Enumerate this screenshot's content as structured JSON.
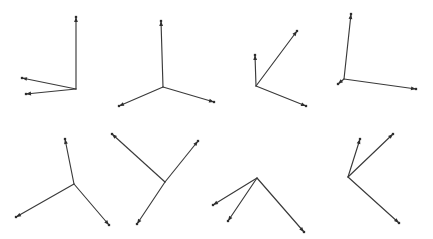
{
  "figure": {
    "title": "",
    "background_color": "#ffffff",
    "stroke_color": "#3a3a3a",
    "marker_color": "#2e2e2e",
    "width": 433,
    "height": 239
  },
  "chart_data": {
    "type": "scatter",
    "title": "",
    "xlabel": "",
    "ylabel": "",
    "xlim": [
      0,
      433
    ],
    "ylim": [
      239,
      0
    ],
    "grid": false,
    "legend": null,
    "shapes": [
      {
        "name": "arrow-figure-1",
        "row": 1,
        "column": 1,
        "vertex": [
          76,
          89
        ],
        "arms": [
          {
            "name": "arm-up",
            "tip": [
              76,
              17
            ]
          },
          {
            "name": "arm-left-upper",
            "tip": [
              22,
              78
            ]
          },
          {
            "name": "arm-left-lower",
            "tip": [
              26,
              94
            ]
          }
        ]
      },
      {
        "name": "arrow-figure-2",
        "row": 1,
        "column": 2,
        "vertex": [
          163,
          87
        ],
        "arms": [
          {
            "name": "arm-up",
            "tip": [
              161,
              21
            ]
          },
          {
            "name": "arm-down-left",
            "tip": [
              119,
              106
            ]
          },
          {
            "name": "arm-down-right",
            "tip": [
              214,
              102
            ]
          }
        ]
      },
      {
        "name": "arrow-figure-3",
        "row": 1,
        "column": 3,
        "vertex": [
          256,
          86
        ],
        "arms": [
          {
            "name": "arm-up",
            "tip": [
              255,
              55
            ]
          },
          {
            "name": "arm-up-right",
            "tip": [
              297,
              31
            ]
          },
          {
            "name": "arm-down-right",
            "tip": [
              306,
              106
            ]
          }
        ]
      },
      {
        "name": "arrow-figure-4",
        "row": 1,
        "column": 4,
        "vertex": [
          344,
          79
        ],
        "arms": [
          {
            "name": "arm-up",
            "tip": [
              351,
              14
            ]
          },
          {
            "name": "arm-down-left-short",
            "tip": [
              338,
              84
            ]
          },
          {
            "name": "arm-right",
            "tip": [
              416,
              89
            ]
          }
        ]
      },
      {
        "name": "arrow-figure-5",
        "row": 2,
        "column": 1,
        "vertex": [
          74,
          184
        ],
        "arms": [
          {
            "name": "arm-up",
            "tip": [
              65,
              139
            ]
          },
          {
            "name": "arm-down-left",
            "tip": [
              16,
              217
            ]
          },
          {
            "name": "arm-down-right",
            "tip": [
              109,
              225
            ]
          }
        ]
      },
      {
        "name": "arrow-figure-6",
        "row": 2,
        "column": 2,
        "vertex": [
          165,
          182
        ],
        "arms": [
          {
            "name": "arm-up-left",
            "tip": [
              112,
              134
            ]
          },
          {
            "name": "arm-up-right",
            "tip": [
              198,
              141
            ]
          },
          {
            "name": "arm-down-left",
            "tip": [
              137,
              224
            ]
          }
        ]
      },
      {
        "name": "arrow-figure-7",
        "row": 2,
        "column": 3,
        "vertex": [
          257,
          178
        ],
        "arms": [
          {
            "name": "arm-down-left-upper",
            "tip": [
              213,
              205
            ]
          },
          {
            "name": "arm-down-left-lower",
            "tip": [
              228,
              221
            ]
          },
          {
            "name": "arm-down-right",
            "tip": [
              304,
              232
            ]
          }
        ]
      },
      {
        "name": "arrow-figure-8",
        "row": 2,
        "column": 4,
        "vertex": [
          348,
          177
        ],
        "arms": [
          {
            "name": "arm-up",
            "tip": [
              360,
              139
            ]
          },
          {
            "name": "arm-up-right",
            "tip": [
              393,
              134
            ]
          },
          {
            "name": "arm-down-right",
            "tip": [
              399,
              223
            ]
          }
        ]
      }
    ]
  }
}
